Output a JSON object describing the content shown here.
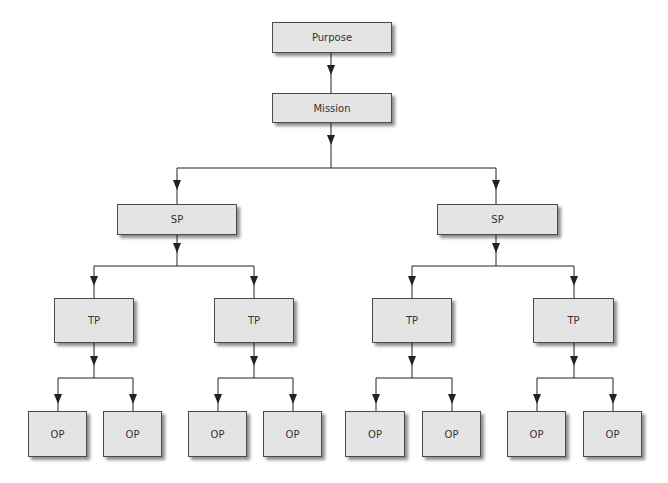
{
  "diagram": {
    "type": "hierarchy-tree",
    "colors": {
      "background": "#ffffff",
      "box_fill": "#e4e4e4",
      "box_border": "#4a4a4a",
      "text": "#333333",
      "connector": "#222222"
    },
    "nodes": {
      "purpose": {
        "label": "Purpose"
      },
      "mission": {
        "label": "Mission"
      },
      "sp_left": {
        "label": "SP"
      },
      "sp_right": {
        "label": "SP"
      },
      "tp_1": {
        "label": "TP"
      },
      "tp_2": {
        "label": "TP"
      },
      "tp_3": {
        "label": "TP"
      },
      "tp_4": {
        "label": "TP"
      },
      "op_1": {
        "label": "OP"
      },
      "op_2": {
        "label": "OP"
      },
      "op_3": {
        "label": "OP"
      },
      "op_4": {
        "label": "OP"
      },
      "op_5": {
        "label": "OP"
      },
      "op_6": {
        "label": "OP"
      },
      "op_7": {
        "label": "OP"
      },
      "op_8": {
        "label": "OP"
      }
    },
    "edges": [
      [
        "purpose",
        "mission"
      ],
      [
        "mission",
        "sp_left"
      ],
      [
        "mission",
        "sp_right"
      ],
      [
        "sp_left",
        "tp_1"
      ],
      [
        "sp_left",
        "tp_2"
      ],
      [
        "sp_right",
        "tp_3"
      ],
      [
        "sp_right",
        "tp_4"
      ],
      [
        "tp_1",
        "op_1"
      ],
      [
        "tp_1",
        "op_2"
      ],
      [
        "tp_2",
        "op_3"
      ],
      [
        "tp_2",
        "op_4"
      ],
      [
        "tp_3",
        "op_5"
      ],
      [
        "tp_3",
        "op_6"
      ],
      [
        "tp_4",
        "op_7"
      ],
      [
        "tp_4",
        "op_8"
      ]
    ]
  }
}
